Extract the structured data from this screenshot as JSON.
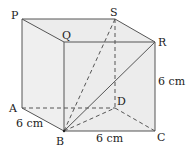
{
  "diagram": {
    "type": "cuboid",
    "colors": {
      "face_fill": "#ececec",
      "edge": "#555555",
      "text": "#222222",
      "background": "#ffffff"
    },
    "vertices": {
      "P": {
        "label": "P",
        "x": 22,
        "y": 19
      },
      "S": {
        "label": "S",
        "x": 115,
        "y": 19
      },
      "Q": {
        "label": "Q",
        "x": 64,
        "y": 42
      },
      "R": {
        "label": "R",
        "x": 155,
        "y": 42
      },
      "A": {
        "label": "A",
        "x": 22,
        "y": 108
      },
      "D": {
        "label": "D",
        "x": 115,
        "y": 108
      },
      "B": {
        "label": "B",
        "x": 64,
        "y": 131
      },
      "C": {
        "label": "C",
        "x": 155,
        "y": 131
      }
    },
    "solid_edges": [
      "PQ",
      "PS",
      "QR",
      "SR",
      "PA",
      "AB",
      "QB",
      "BC",
      "RC",
      "BR"
    ],
    "dashed_edges": [
      "AD",
      "DC",
      "SD",
      "BS",
      "BD"
    ],
    "measurements": {
      "ab": "6 cm",
      "bc": "6 cm",
      "rc": "6 cm"
    }
  }
}
